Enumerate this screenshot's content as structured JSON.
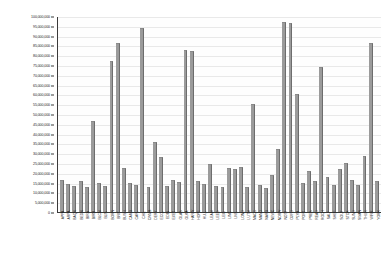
{
  "chart_data": {
    "type": "bar",
    "title": "",
    "subtitle": "",
    "xlabel": "",
    "ylabel": "",
    "ylim": [
      0,
      100000000
    ],
    "grid": true,
    "legend": false,
    "legend_position": "none",
    "series_name": "Value",
    "bar_color": "#9b9b9b",
    "bar_edge_color": "#6d6d6d",
    "axis_color": "#3a3a3a",
    "gridline_color": "#e9e9e9",
    "background_color": "#ffffff",
    "y_tick_labels": [
      "100,000,000",
      "95,000,000",
      "90,000,000",
      "85,000,000",
      "80,000,000",
      "75,000,000",
      "70,000,000",
      "65,000,000",
      "60,000,000",
      "55,000,000",
      "50,000,000",
      "45,000,000",
      "40,000,000",
      "35,000,000",
      "30,000,000",
      "25,000,000",
      "20,000,000",
      "15,000,000",
      "10,000,000",
      "5,000,000",
      "0"
    ],
    "y_tick_values": [
      100000000,
      95000000,
      90000000,
      85000000,
      80000000,
      75000000,
      70000000,
      65000000,
      60000000,
      55000000,
      50000000,
      45000000,
      40000000,
      35000000,
      30000000,
      25000000,
      20000000,
      15000000,
      10000000,
      5000000,
      0
    ],
    "categories": [
      "APPA",
      "ARPA",
      "BAQN",
      "BEDN",
      "BIRA",
      "BIRM",
      "BLCN",
      "BLIS",
      "BORN",
      "BRIT",
      "BUSH",
      "CAMB",
      "CARL",
      "CHIL",
      "CWMB",
      "DERY",
      "ECCL",
      "EDIN",
      "EXET",
      "GLAS",
      "GLKA",
      "HARW",
      "HOPE",
      "HULL",
      "LEAM",
      "LEED",
      "LEIC",
      "LINC",
      "LIVE",
      "LOND",
      "LUTN",
      "MACC",
      "MAND",
      "NARB",
      "NEWC",
      "NORW",
      "NOTT",
      "OXFD",
      "PLYM",
      "PORT",
      "PRES",
      "READ",
      "ROCH",
      "SALF",
      "SHEF",
      "SOUT",
      "STOK",
      "SUND",
      "SWAN",
      "THUR",
      "WIRR",
      "YORK"
    ],
    "values": [
      16200000,
      14100000,
      13300000,
      15800000,
      12600000,
      46500000,
      14700000,
      13100000,
      77200000,
      86200000,
      22500000,
      14600000,
      13900000,
      93800000,
      12900000,
      35600000,
      27900000,
      13400000,
      16100000,
      15400000,
      82600000,
      82100000,
      16000000,
      14200000,
      24300000,
      13200000,
      12700000,
      22600000,
      21900000,
      23100000,
      12800000,
      55200000,
      13600000,
      12400000,
      18900000,
      32100000,
      96900000,
      96400000,
      60100000,
      14800000,
      21100000,
      15600000,
      74100000,
      17900000,
      13800000,
      21800000,
      24900000,
      16400000,
      13700000,
      28800000,
      86400000,
      15900000
    ]
  }
}
